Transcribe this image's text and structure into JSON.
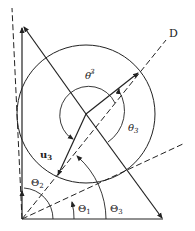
{
  "diagram": {
    "labels": {
      "D": "D",
      "theta3_prime": "θ′",
      "theta3_prime_sub": "3",
      "theta3": "θ",
      "theta3_sub": "3",
      "u3": "u",
      "u3_sub": "3",
      "Theta1": "Θ",
      "Theta1_sub": "1",
      "Theta2": "Θ",
      "Theta2_sub": "2",
      "Theta3": "Θ",
      "Theta3_sub": "3"
    },
    "colors": {
      "stroke": "#222222",
      "background": "#ffffff"
    }
  }
}
